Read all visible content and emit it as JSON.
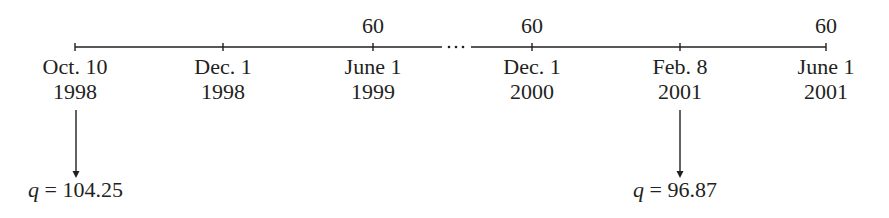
{
  "timeline": {
    "ticks": [
      {
        "x": 75,
        "date": "Oct. 10",
        "year": "1998",
        "top": ""
      },
      {
        "x": 223,
        "date": "Dec. 1",
        "year": "1998",
        "top": ""
      },
      {
        "x": 373,
        "date": "June 1",
        "year": "1999",
        "top": "60"
      },
      {
        "x": 532,
        "date": "Dec. 1",
        "year": "2000",
        "top": "60"
      },
      {
        "x": 680,
        "date": "Feb. 8",
        "year": "2001",
        "top": ""
      },
      {
        "x": 826,
        "date": "June 1",
        "year": "2001",
        "top": "60"
      }
    ],
    "ellipsis": "···",
    "arrows": [
      {
        "x": 76,
        "var": "q",
        "eq": " = ",
        "value": "104.25"
      },
      {
        "x": 680,
        "var": "q",
        "eq": " = ",
        "value": "96.87"
      }
    ]
  },
  "colors": {
    "line": "#231f20",
    "text": "#231f20"
  }
}
